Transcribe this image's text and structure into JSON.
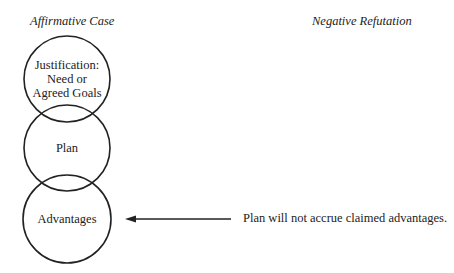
{
  "headers": {
    "affirmative": "Affirmative Case",
    "negative": "Negative Refutation"
  },
  "circles": [
    {
      "id": "justification",
      "lines": [
        "Justification:",
        "Need or",
        "Agreed Goals"
      ]
    },
    {
      "id": "plan",
      "lines": [
        "Plan"
      ]
    },
    {
      "id": "advantages",
      "lines": [
        "Advantages"
      ]
    }
  ],
  "refutation": {
    "text": "Plan will not accrue claimed advantages.",
    "target": "advantages"
  },
  "colors": {
    "stroke": "#222222",
    "background": "#ffffff"
  }
}
